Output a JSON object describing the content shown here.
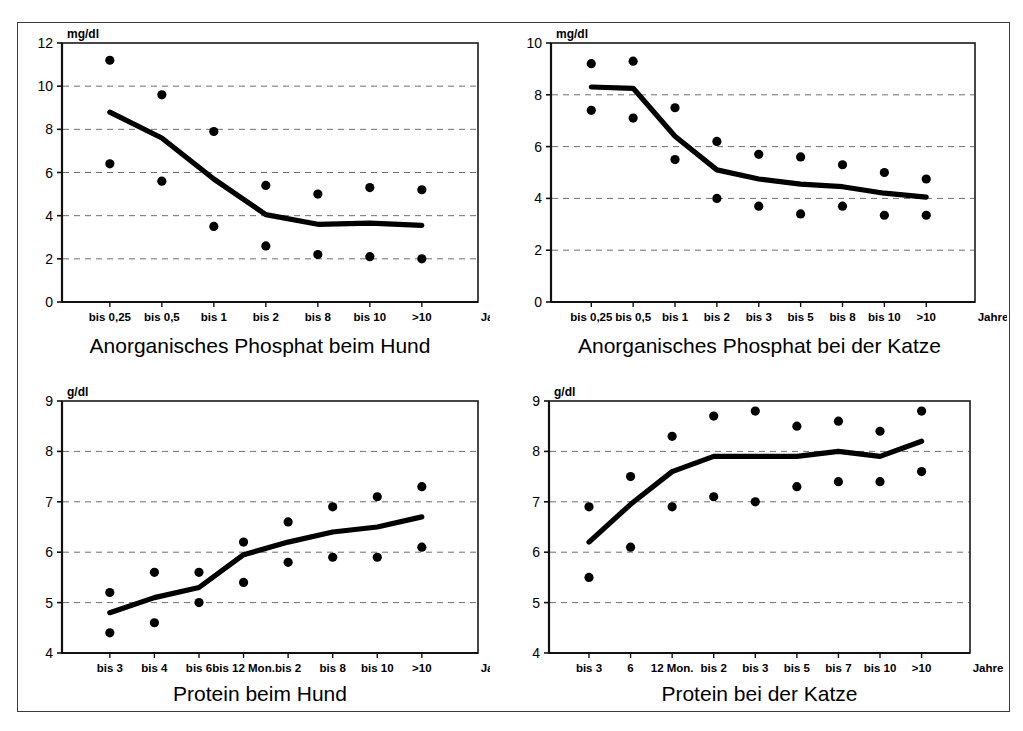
{
  "figure": {
    "background": "#ffffff",
    "frame_color": "#3a3a3a",
    "series_color": "#000000",
    "grid_color": "#7a7a7a"
  },
  "panels": [
    {
      "key": "phosphat_hund",
      "caption": "Anorganisches Phosphat beim Hund",
      "unit": "mg/dl",
      "xaxis_unit": "Jahre"
    },
    {
      "key": "phosphat_katze",
      "caption": "Anorganisches Phosphat bei der Katze",
      "unit": "mg/dl",
      "xaxis_unit": "Jahre"
    },
    {
      "key": "protein_hund",
      "caption": "Protein beim Hund",
      "unit": "g/dl",
      "xaxis_unit": "Jahre"
    },
    {
      "key": "protein_katze",
      "caption": "Protein bei der Katze",
      "unit": "g/dl",
      "xaxis_unit": "Jahre"
    }
  ],
  "chart_data": [
    {
      "type": "scatter",
      "id": "phosphat_hund",
      "title": "Anorganisches Phosphat beim Hund",
      "xlabel": "Jahre",
      "ylabel": "mg/dl",
      "categories": [
        "bis 0,25",
        "bis 0,5",
        "bis 1",
        "bis 2",
        "bis 8",
        "bis 10",
        ">10"
      ],
      "ylim": [
        0,
        12
      ],
      "yticks": [
        0,
        2,
        4,
        6,
        8,
        10,
        12
      ],
      "grid": "horizontal-dashed",
      "legend": "none",
      "series": [
        {
          "name": "oberer Referenzwert",
          "values": [
            11.2,
            9.6,
            7.9,
            5.4,
            5.0,
            5.3,
            5.2
          ]
        },
        {
          "name": "Mittelwert (Linie)",
          "type": "line",
          "values": [
            8.8,
            7.6,
            5.7,
            4.05,
            3.6,
            3.65,
            3.55
          ]
        },
        {
          "name": "unterer Referenzwert",
          "values": [
            6.4,
            5.6,
            3.5,
            2.6,
            2.2,
            2.1,
            2.0
          ]
        }
      ]
    },
    {
      "type": "scatter",
      "id": "phosphat_katze",
      "title": "Anorganisches Phosphat bei der Katze",
      "xlabel": "Jahre",
      "ylabel": "mg/dl",
      "categories": [
        "bis 0,25",
        "bis 0,5",
        "bis 1",
        "bis 2",
        "bis 3",
        "bis 5",
        "bis 8",
        "bis 10",
        ">10"
      ],
      "ylim": [
        0,
        10
      ],
      "yticks": [
        0,
        2,
        4,
        6,
        8,
        10
      ],
      "grid": "horizontal-dashed",
      "legend": "none",
      "series": [
        {
          "name": "oberer Referenzwert",
          "values": [
            9.2,
            9.3,
            7.5,
            6.2,
            5.7,
            5.6,
            5.3,
            5.0,
            4.75
          ]
        },
        {
          "name": "Mittelwert (Linie)",
          "type": "line",
          "values": [
            8.3,
            8.25,
            6.4,
            5.1,
            4.75,
            4.55,
            4.45,
            4.2,
            4.05
          ]
        },
        {
          "name": "unterer Referenzwert",
          "values": [
            7.4,
            7.1,
            5.5,
            4.0,
            3.7,
            3.4,
            3.7,
            3.35,
            3.35
          ]
        }
      ]
    },
    {
      "type": "scatter",
      "id": "protein_hund",
      "title": "Protein beim Hund",
      "xlabel": "Jahre",
      "ylabel": "g/dl",
      "categories": [
        "bis 3",
        "bis 4",
        "bis 6",
        "bis 12 Mon.",
        "bis 2",
        "bis 8",
        "bis 10",
        ">10"
      ],
      "ylim": [
        4,
        9
      ],
      "yticks": [
        4,
        5,
        6,
        7,
        8,
        9
      ],
      "grid": "horizontal-dashed",
      "legend": "none",
      "series": [
        {
          "name": "oberer Referenzwert",
          "values": [
            5.2,
            5.6,
            5.6,
            6.2,
            6.6,
            6.9,
            7.1,
            7.3
          ]
        },
        {
          "name": "Mittelwert (Linie)",
          "type": "line",
          "values": [
            4.8,
            5.1,
            5.3,
            5.95,
            6.2,
            6.4,
            6.5,
            6.7
          ]
        },
        {
          "name": "unterer Referenzwert",
          "values": [
            4.4,
            4.6,
            5.0,
            5.4,
            5.8,
            5.9,
            5.9,
            6.1
          ]
        }
      ]
    },
    {
      "type": "scatter",
      "id": "protein_katze",
      "title": "Protein bei der Katze",
      "xlabel": "Jahre",
      "ylabel": "g/dl",
      "categories": [
        "bis 3",
        "6",
        "12 Mon.",
        "bis 2",
        "bis 3",
        "bis 5",
        "bis 7",
        "bis 10",
        ">10"
      ],
      "ylim": [
        4,
        9
      ],
      "yticks": [
        4,
        5,
        6,
        7,
        8,
        9
      ],
      "grid": "horizontal-dashed",
      "legend": "none",
      "series": [
        {
          "name": "oberer Referenzwert",
          "values": [
            6.9,
            7.5,
            8.3,
            8.7,
            8.8,
            8.5,
            8.6,
            8.4,
            8.8
          ]
        },
        {
          "name": "Mittelwert (Linie)",
          "type": "line",
          "values": [
            6.2,
            6.95,
            7.6,
            7.9,
            7.9,
            7.9,
            8.0,
            7.9,
            8.2
          ]
        },
        {
          "name": "mittlerer Referenzwert",
          "values": [
            5.5,
            6.1,
            6.9,
            7.1,
            7.0,
            7.3,
            7.4,
            7.4,
            7.6
          ]
        }
      ]
    }
  ]
}
